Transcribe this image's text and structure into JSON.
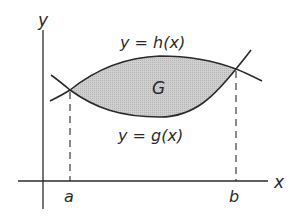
{
  "figure": {
    "axis_labels": {
      "x": "x",
      "y": "y"
    },
    "tick_labels": {
      "a": "a",
      "b": "b"
    },
    "region_label": "G",
    "curves": {
      "upper": {
        "name": "h",
        "label": "y = h(x)"
      },
      "lower": {
        "name": "g",
        "label": "y = g(x)"
      }
    },
    "colors": {
      "region_fill": "#c8c8c8",
      "stroke": "#2a2a2a"
    }
  }
}
